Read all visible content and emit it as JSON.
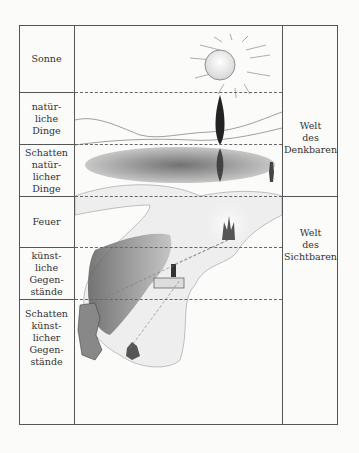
{
  "left_column": {
    "rows": [
      {
        "label": "Sonne"
      },
      {
        "label": "natür-\nliche\nDinge"
      },
      {
        "label": "Schatten\nnatür-\nlicher\nDinge"
      },
      {
        "label": "Feuer"
      },
      {
        "label": "künst-\nliche Gegen-\nstände"
      },
      {
        "label": "Schatten\nkünst-\nlicher\nGegen-\nstände"
      }
    ]
  },
  "right_column": {
    "sections": [
      {
        "label": "Welt\ndes\nDenkbaren"
      },
      {
        "label": "Welt\ndes\nSichtbaren"
      }
    ]
  },
  "illustration": {
    "elements": [
      "sun",
      "tree",
      "tree-reflection",
      "lake",
      "standing-figure",
      "fire",
      "wall",
      "carried-object-figure",
      "cave-wall",
      "chained-prisoner",
      "rock-passage"
    ]
  }
}
